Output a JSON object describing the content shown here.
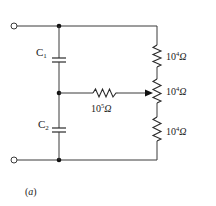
{
  "diagram": {
    "type": "circuit",
    "caption": "(a)",
    "caption_paren_open": "(",
    "caption_letter": "a",
    "caption_paren_close": ")",
    "capacitors": [
      {
        "id": "C1",
        "letter": "C",
        "subscript": "1"
      },
      {
        "id": "C2",
        "letter": "C",
        "subscript": "2"
      }
    ],
    "resistors": [
      {
        "id": "R_top",
        "base": "10",
        "exponent": "4",
        "unit": "Ω",
        "label": "10^4 Ω"
      },
      {
        "id": "R_mid_pot",
        "base": "10",
        "exponent": "4",
        "unit": "Ω",
        "label": "10^4 Ω"
      },
      {
        "id": "R_bottom",
        "base": "10",
        "exponent": "4",
        "unit": "Ω",
        "label": "10^4 Ω"
      },
      {
        "id": "R_series",
        "base": "10",
        "exponent": "5",
        "unit": "Ω",
        "label": "10^5 Ω"
      }
    ],
    "terminals": [
      "input-top",
      "input-bottom"
    ],
    "junctions": [
      "top-left-node",
      "middle-node",
      "bottom-left-node"
    ],
    "colors": {
      "line": "#2a2a2a",
      "background": "#ffffff"
    }
  }
}
